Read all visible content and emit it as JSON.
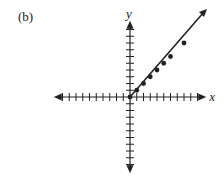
{
  "panel_label": "(b)",
  "axes": {
    "x_label": "x",
    "y_label": "y",
    "ticks_per_side": 10,
    "origin_px": [
      130,
      97
    ],
    "unit_px": 6.75
  },
  "colors": {
    "ink": "#222222",
    "background": "#ffffff"
  },
  "chart_data": {
    "type": "line",
    "title": "(b)",
    "xlabel": "x",
    "ylabel": "y",
    "xlim": [
      -10,
      10
    ],
    "ylim": [
      -10,
      10
    ],
    "grid": false,
    "ray": {
      "start": [
        0,
        0
      ],
      "direction": [
        1,
        1
      ],
      "arrow_at_end": true,
      "equation": "y = x, x >= 0"
    },
    "points": [
      {
        "x": 0,
        "y": 0
      },
      {
        "x": 1,
        "y": 1
      },
      {
        "x": 2,
        "y": 2
      },
      {
        "x": 3,
        "y": 3
      },
      {
        "x": 4,
        "y": 4
      },
      {
        "x": 5,
        "y": 5
      },
      {
        "x": 6,
        "y": 6
      },
      {
        "x": 8,
        "y": 8
      }
    ]
  }
}
